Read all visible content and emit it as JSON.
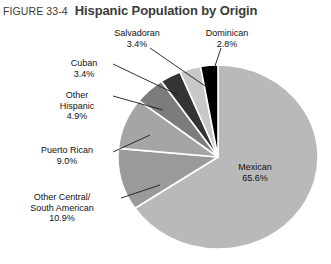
{
  "figure": {
    "number": "FIGURE 33-4",
    "title": "Hispanic Population by Origin"
  },
  "labels": {
    "mexican": {
      "name": "Mexican",
      "value": "65.6%"
    },
    "other_central_south_american": {
      "name_line1": "Other Central/",
      "name_line2": "South American",
      "value": "10.9%"
    },
    "puerto_rican": {
      "name": "Puerto Rican",
      "value": "9.0%"
    },
    "other_hispanic": {
      "name_line1": "Other",
      "name_line2": "Hispanic",
      "value": "4.9%"
    },
    "cuban": {
      "name": "Cuban",
      "value": "3.4%"
    },
    "salvadoran": {
      "name": "Salvadoran",
      "value": "3.4%"
    },
    "dominican": {
      "name": "Dominican",
      "value": "2.8%"
    }
  },
  "chart_data": {
    "type": "pie",
    "title": "Hispanic Population by Origin",
    "xlabel": "",
    "ylabel": "",
    "legend": "none",
    "grid": false,
    "value_unit": "percent",
    "total": 100.0,
    "start_angle_deg": 0,
    "direction": "clockwise",
    "categories": [
      "Mexican",
      "Other Central/South American",
      "Puerto Rican",
      "Other Hispanic",
      "Cuban",
      "Salvadoran",
      "Dominican"
    ],
    "values": [
      65.6,
      10.9,
      9.0,
      4.9,
      3.4,
      3.4,
      2.8
    ],
    "labels": [
      "Mexican 65.6%",
      "Other Central/South American 10.9%",
      "Puerto Rican 9.0%",
      "Other Hispanic 4.9%",
      "Cuban 3.4%",
      "Salvadoran 3.4%",
      "Dominican 2.8%"
    ],
    "colors": [
      "#b9b9b9",
      "#9a9a9a",
      "#a5a5a5",
      "#7c7c7c",
      "#343434",
      "#c8c8c8",
      "#000000"
    ],
    "slice_separator_color": "#ffffff"
  },
  "geometry": {
    "center_x": 218,
    "center_y": 157,
    "radius_x": 100,
    "radius_y": 92
  },
  "colors": {
    "background": "#ffffff",
    "title_text": "#3a3a3a",
    "label_text": "#111111",
    "leader_line": "#1a1a1a"
  }
}
